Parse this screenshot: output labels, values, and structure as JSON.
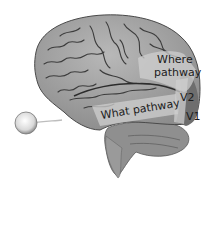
{
  "diagram": {
    "labels": {
      "where_line1": "Where",
      "where_line2": "pathway",
      "v2": "V2",
      "v1": "V1",
      "what": "What pathway"
    },
    "colors": {
      "background": "#ffffff",
      "cortex": "#a8a8a8",
      "sulci": "#3c3c3c",
      "pathway_highlight": "#cfcfcf",
      "v1_region": "#6e6e6e",
      "eye": "#e6e6e6",
      "text": "#1c1c1c"
    }
  }
}
